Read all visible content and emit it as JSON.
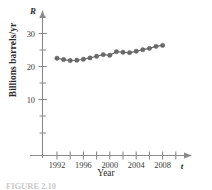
{
  "figure": {
    "caption": "FIGURE 2.10",
    "y_axis_variable": "R",
    "x_axis_variable": "t",
    "y_axis_label": "Billions barrels/yr",
    "x_axis_label": "Year"
  },
  "chart_data": {
    "type": "line",
    "title": "",
    "subtitle": "",
    "xlabel": "Year",
    "ylabel": "Billions barrels/yr",
    "x_variable_symbol": "t",
    "y_variable_symbol": "R",
    "xlim": [
      1990,
      2010
    ],
    "ylim": [
      0,
      36
    ],
    "grid": false,
    "legend": "none",
    "x_major_ticks": [
      1992,
      1996,
      2000,
      2004,
      2008
    ],
    "x_minor_ticks": [
      1994,
      1998,
      2002,
      2006,
      2010
    ],
    "x_tick_labels": [
      "1992",
      "1996",
      "2000",
      "2004",
      "2008"
    ],
    "y_major_ticks": [
      10,
      20,
      30
    ],
    "y_minor_ticks": [
      5,
      15,
      25,
      35
    ],
    "y_tick_labels": [
      "10",
      "20",
      "30"
    ],
    "marker": "filled-circle",
    "marker_color": "#6a6a6a",
    "line_color": "#6e6e6e",
    "axis_color": "#8a8a8a",
    "x": [
      1992,
      1993,
      1994,
      1995,
      1996,
      1997,
      1998,
      1999,
      2000,
      2001,
      2002,
      2003,
      2004,
      2005,
      2006,
      2007,
      2008
    ],
    "values": [
      22.5,
      22.1,
      21.8,
      21.9,
      22.2,
      22.6,
      23.1,
      23.6,
      23.4,
      24.5,
      24.3,
      24.2,
      24.6,
      25.1,
      25.5,
      26.1,
      26.4
    ],
    "series": [
      {
        "name": "World oil production",
        "values": [
          22.5,
          22.1,
          21.8,
          21.9,
          22.2,
          22.6,
          23.1,
          23.6,
          23.4,
          24.5,
          24.3,
          24.2,
          24.6,
          25.1,
          25.5,
          26.1,
          26.4
        ]
      }
    ]
  }
}
